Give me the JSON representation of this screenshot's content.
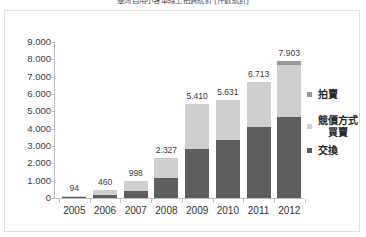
{
  "chart_data": {
    "type": "bar",
    "subtype": "stacked-bar",
    "title": "臺灣自用小客車線上拍賣統計 (件數統計)",
    "xlabel": "",
    "ylabel": "",
    "categories": [
      "2005",
      "2006",
      "2007",
      "2008",
      "2009",
      "2010",
      "2011",
      "2012"
    ],
    "series": [
      {
        "name": "交換",
        "color": "#5e5e5e",
        "values": [
          30,
          170,
          390,
          1150,
          2800,
          3330,
          4080,
          4660
        ]
      },
      {
        "name": "競價方式買賣",
        "color": "#cfcfcf",
        "values": [
          64,
          290,
          608,
          1177,
          2610,
          2301,
          2633,
          3000
        ]
      },
      {
        "name": "拍賣",
        "color": "#9a9a9a",
        "values": [
          0,
          0,
          0,
          0,
          0,
          0,
          0,
          243
        ]
      }
    ],
    "totals": [
      "94",
      "460",
      "998",
      "2.327",
      "5.410",
      "5.631",
      "6.713",
      "7.903"
    ],
    "total_values": [
      94,
      460,
      998,
      2327,
      5410,
      5631,
      6713,
      7903
    ],
    "ylim": [
      0,
      9000
    ],
    "ytick_values": [
      0,
      1000,
      2000,
      3000,
      4000,
      5000,
      6000,
      7000,
      8000,
      9000
    ],
    "ytick_labels": [
      "9.000",
      "8.000",
      "7.000",
      "6.000",
      "5.000",
      "4.000",
      "3.000",
      "2.000",
      "1.000",
      "0"
    ],
    "grid": false,
    "legend_position": "right",
    "legend": [
      {
        "label": "拍賣",
        "label_line2": "",
        "color": "#9a9a9a"
      },
      {
        "label": "競價方式",
        "label_line2": "買賣",
        "color": "#cfcfcf"
      },
      {
        "label": "交換",
        "label_line2": "",
        "color": "#5e5e5e"
      }
    ]
  },
  "colors": {
    "frame_border": "#e2e2e2",
    "axis": "#bfbfbf",
    "text": "#333333",
    "background": "#ffffff"
  }
}
